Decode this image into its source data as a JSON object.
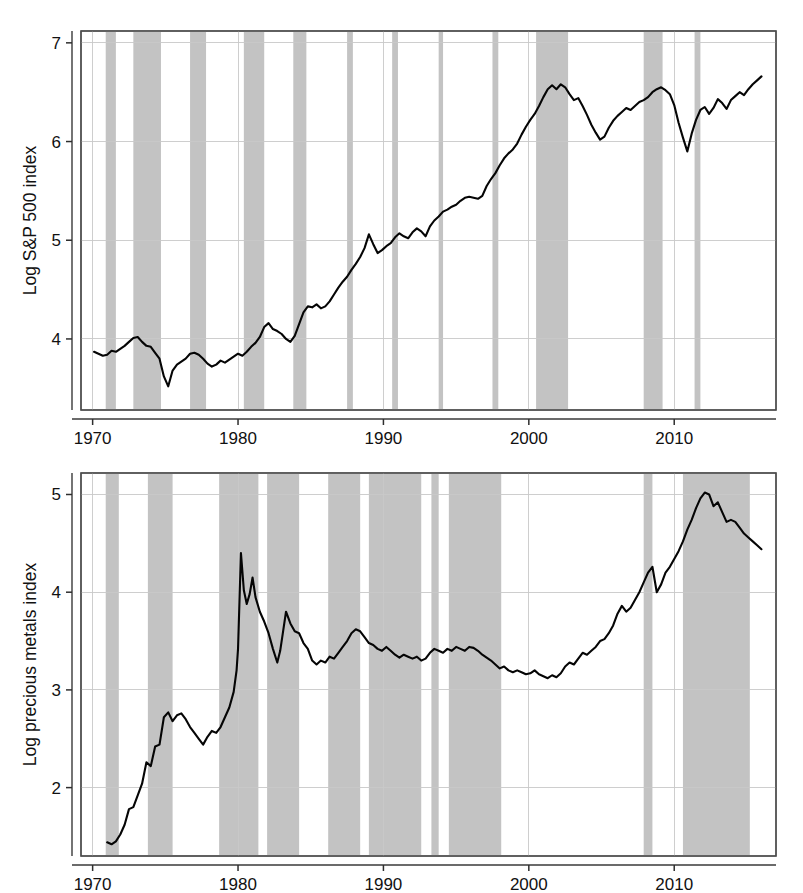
{
  "figure": {
    "width": 803,
    "height": 893,
    "background": "#ffffff",
    "line_color": "#050505",
    "band_color": "#b8b8b8",
    "grid_color": "#c9c9c9",
    "frame_color": "#4a4a4a"
  },
  "chart_data": [
    {
      "id": "sp500",
      "type": "line",
      "title": "",
      "xlabel": "",
      "ylabel": "Log S&P 500 index",
      "xlim": [
        1969.2,
        1017.0
      ],
      "x_range": [
        1969.2,
        2017.0
      ],
      "ylim": [
        3.28,
        7.12
      ],
      "grid": true,
      "legend": "none",
      "xticks": [
        1970,
        1980,
        1990,
        2000,
        2010
      ],
      "xtick_labels": [
        "1970",
        "1980",
        "1990",
        "2000",
        "2010"
      ],
      "yticks": [
        4,
        5,
        6,
        7
      ],
      "ytick_labels": [
        "4",
        "5",
        "6",
        "7"
      ],
      "shaded_regions_label": "recession bands",
      "shaded_regions": [
        [
          1970.9,
          1971.6
        ],
        [
          1972.8,
          1974.7
        ],
        [
          1976.7,
          1977.8
        ],
        [
          1980.4,
          1981.8
        ],
        [
          1983.8,
          1984.7
        ],
        [
          1987.5,
          1987.9
        ],
        [
          1990.6,
          1991.0
        ],
        [
          1993.8,
          1994.1
        ],
        [
          1997.5,
          1997.9
        ],
        [
          2000.5,
          2002.7
        ],
        [
          2007.9,
          2009.2
        ],
        [
          2011.4,
          2011.8
        ]
      ],
      "x": [
        1970.1,
        1970.4,
        1970.7,
        1971.0,
        1971.3,
        1971.6,
        1971.9,
        1972.2,
        1972.5,
        1972.8,
        1973.1,
        1973.4,
        1973.7,
        1974.0,
        1974.3,
        1974.6,
        1974.9,
        1975.2,
        1975.5,
        1975.8,
        1976.1,
        1976.4,
        1976.7,
        1977.0,
        1977.3,
        1977.6,
        1977.9,
        1978.2,
        1978.5,
        1978.8,
        1979.1,
        1979.4,
        1979.7,
        1980.0,
        1980.3,
        1980.6,
        1980.9,
        1981.2,
        1981.5,
        1981.8,
        1982.1,
        1982.4,
        1982.7,
        1983.0,
        1983.3,
        1983.6,
        1983.9,
        1984.2,
        1984.5,
        1984.8,
        1985.1,
        1985.4,
        1985.7,
        1986.0,
        1986.3,
        1986.6,
        1986.9,
        1987.2,
        1987.5,
        1987.8,
        1988.1,
        1988.4,
        1988.7,
        1989.0,
        1989.3,
        1989.6,
        1989.9,
        1990.2,
        1990.5,
        1990.8,
        1991.1,
        1991.4,
        1991.7,
        1992.0,
        1992.3,
        1992.6,
        1992.9,
        1993.2,
        1993.5,
        1993.8,
        1994.1,
        1994.4,
        1994.7,
        1995.0,
        1995.3,
        1995.6,
        1995.9,
        1996.2,
        1996.5,
        1996.8,
        1997.1,
        1997.4,
        1997.7,
        1998.0,
        1998.3,
        1998.6,
        1998.9,
        1999.2,
        1999.5,
        1999.8,
        2000.1,
        2000.4,
        2000.7,
        2001.0,
        2001.3,
        2001.6,
        2001.9,
        2002.2,
        2002.5,
        2002.8,
        2003.1,
        2003.4,
        2003.7,
        2004.0,
        2004.3,
        2004.6,
        2004.9,
        2005.2,
        2005.5,
        2005.8,
        2006.1,
        2006.4,
        2006.7,
        2007.0,
        2007.3,
        2007.6,
        2007.9,
        2008.2,
        2008.5,
        2008.8,
        2009.1,
        2009.4,
        2009.7,
        2010.0,
        2010.3,
        2010.6,
        2010.9,
        2011.2,
        2011.5,
        2011.8,
        2012.1,
        2012.4,
        2012.7,
        2013.0,
        2013.3,
        2013.6,
        2013.9,
        2014.2,
        2014.5,
        2014.8,
        2015.1,
        2015.4,
        2015.7,
        2016.0
      ],
      "y": [
        3.87,
        3.85,
        3.83,
        3.84,
        3.88,
        3.87,
        3.9,
        3.93,
        3.97,
        4.01,
        4.02,
        3.97,
        3.93,
        3.92,
        3.86,
        3.8,
        3.62,
        3.52,
        3.68,
        3.74,
        3.77,
        3.8,
        3.85,
        3.86,
        3.84,
        3.8,
        3.75,
        3.72,
        3.74,
        3.78,
        3.76,
        3.79,
        3.82,
        3.85,
        3.83,
        3.87,
        3.92,
        3.96,
        4.02,
        4.12,
        4.16,
        4.1,
        4.08,
        4.05,
        4.0,
        3.97,
        4.03,
        4.15,
        4.27,
        4.33,
        4.32,
        4.35,
        4.31,
        4.33,
        4.38,
        4.45,
        4.52,
        4.58,
        4.63,
        4.7,
        4.76,
        4.83,
        4.92,
        5.06,
        4.96,
        4.87,
        4.9,
        4.94,
        4.97,
        5.03,
        5.07,
        5.04,
        5.02,
        5.08,
        5.12,
        5.09,
        5.04,
        5.14,
        5.2,
        5.24,
        5.29,
        5.31,
        5.34,
        5.36,
        5.4,
        5.43,
        5.44,
        5.43,
        5.42,
        5.45,
        5.55,
        5.62,
        5.68,
        5.76,
        5.83,
        5.88,
        5.92,
        5.98,
        6.07,
        6.15,
        6.22,
        6.28,
        6.36,
        6.45,
        6.53,
        6.57,
        6.53,
        6.58,
        6.55,
        6.48,
        6.42,
        6.44,
        6.36,
        6.27,
        6.17,
        6.09,
        6.02,
        6.05,
        6.14,
        6.21,
        6.26,
        6.3,
        6.34,
        6.32,
        6.36,
        6.4,
        6.42,
        6.45,
        6.5,
        6.53,
        6.55,
        6.52,
        6.48,
        6.37,
        6.19,
        6.04,
        5.9,
        6.08,
        6.22,
        6.32,
        6.35,
        6.28,
        6.34,
        6.43,
        6.39,
        6.33,
        6.42,
        6.46,
        6.5,
        6.47,
        6.53,
        6.58,
        6.62,
        6.66,
        6.7,
        6.74,
        6.78,
        6.82,
        6.86,
        6.9,
        6.88,
        6.9
      ]
    },
    {
      "id": "precious-metals",
      "type": "line",
      "title": "",
      "xlabel": "",
      "ylabel": "Log precious metals index",
      "xlim": [
        1969.2,
        2017.0
      ],
      "x_range": [
        1969.2,
        2017.0
      ],
      "ylim": [
        1.3,
        5.22
      ],
      "grid": true,
      "legend": "none",
      "xticks": [
        1970,
        1980,
        1990,
        2000,
        2010
      ],
      "xtick_labels": [
        "1970",
        "1980",
        "1990",
        "2000",
        "2010"
      ],
      "yticks": [
        2,
        3,
        4,
        5
      ],
      "ytick_labels": [
        "2",
        "3",
        "4",
        "5"
      ],
      "shaded_regions_label": "recession bands",
      "shaded_regions": [
        [
          1970.9,
          1971.8
        ],
        [
          1973.8,
          1975.5
        ],
        [
          1978.7,
          1981.4
        ],
        [
          1982.0,
          1984.2
        ],
        [
          1986.2,
          1988.4
        ],
        [
          1989.0,
          1992.6
        ],
        [
          1993.3,
          1993.8
        ],
        [
          1994.5,
          1998.1
        ],
        [
          2007.9,
          2008.5
        ],
        [
          2010.6,
          2015.2
        ]
      ],
      "x": [
        1971.0,
        1971.3,
        1971.6,
        1971.9,
        1972.2,
        1972.5,
        1972.8,
        1973.1,
        1973.4,
        1973.7,
        1974.0,
        1974.3,
        1974.6,
        1974.9,
        1975.2,
        1975.5,
        1975.8,
        1976.1,
        1976.4,
        1976.7,
        1977.0,
        1977.3,
        1977.6,
        1977.9,
        1978.2,
        1978.5,
        1978.8,
        1979.1,
        1979.4,
        1979.7,
        1979.9,
        1980.0,
        1980.2,
        1980.4,
        1980.6,
        1980.8,
        1981.0,
        1981.2,
        1981.5,
        1981.8,
        1982.1,
        1982.4,
        1982.7,
        1982.9,
        1983.1,
        1983.3,
        1983.6,
        1983.9,
        1984.2,
        1984.5,
        1984.8,
        1985.1,
        1985.4,
        1985.7,
        1986.0,
        1986.3,
        1986.6,
        1986.9,
        1987.2,
        1987.5,
        1987.8,
        1988.1,
        1988.4,
        1988.7,
        1989.0,
        1989.3,
        1989.6,
        1989.9,
        1990.2,
        1990.5,
        1990.8,
        1991.1,
        1991.4,
        1991.7,
        1992.0,
        1992.3,
        1992.6,
        1992.9,
        1993.2,
        1993.5,
        1993.8,
        1994.1,
        1994.4,
        1994.7,
        1995.0,
        1995.3,
        1995.6,
        1995.9,
        1996.2,
        1996.5,
        1996.8,
        1997.1,
        1997.4,
        1997.7,
        1998.0,
        1998.3,
        1998.6,
        1998.9,
        1999.2,
        1999.5,
        1999.8,
        2000.1,
        2000.4,
        2000.7,
        2001.0,
        2001.3,
        2001.6,
        2001.9,
        2002.2,
        2002.5,
        2002.8,
        2003.1,
        2003.4,
        2003.7,
        2004.0,
        2004.3,
        2004.6,
        2004.9,
        2005.2,
        2005.5,
        2005.8,
        2006.1,
        2006.4,
        2006.7,
        2007.0,
        2007.3,
        2007.6,
        2007.9,
        2008.2,
        2008.5,
        2008.8,
        2009.1,
        2009.4,
        2009.7,
        2010.0,
        2010.3,
        2010.6,
        2010.9,
        2011.2,
        2011.5,
        2011.8,
        2012.1,
        2012.4,
        2012.7,
        2013.0,
        2013.3,
        2013.6,
        2013.9,
        2014.2,
        2014.5,
        2014.8,
        2015.1,
        2015.4,
        2015.7,
        2016.0
      ],
      "y": [
        1.44,
        1.42,
        1.45,
        1.52,
        1.62,
        1.78,
        1.8,
        1.92,
        2.04,
        2.26,
        2.22,
        2.42,
        2.44,
        2.72,
        2.77,
        2.68,
        2.74,
        2.76,
        2.7,
        2.62,
        2.56,
        2.5,
        2.44,
        2.52,
        2.58,
        2.56,
        2.62,
        2.72,
        2.82,
        2.98,
        3.2,
        3.42,
        4.4,
        4.02,
        3.88,
        3.98,
        4.15,
        3.95,
        3.8,
        3.7,
        3.58,
        3.42,
        3.28,
        3.4,
        3.6,
        3.8,
        3.68,
        3.6,
        3.58,
        3.48,
        3.42,
        3.3,
        3.26,
        3.3,
        3.28,
        3.34,
        3.32,
        3.38,
        3.44,
        3.5,
        3.58,
        3.62,
        3.6,
        3.54,
        3.48,
        3.46,
        3.42,
        3.4,
        3.44,
        3.4,
        3.36,
        3.33,
        3.36,
        3.34,
        3.32,
        3.34,
        3.3,
        3.32,
        3.38,
        3.42,
        3.4,
        3.38,
        3.42,
        3.4,
        3.44,
        3.42,
        3.4,
        3.44,
        3.43,
        3.4,
        3.36,
        3.33,
        3.3,
        3.26,
        3.22,
        3.24,
        3.2,
        3.18,
        3.2,
        3.18,
        3.16,
        3.17,
        3.2,
        3.16,
        3.14,
        3.12,
        3.15,
        3.13,
        3.17,
        3.24,
        3.28,
        3.26,
        3.32,
        3.38,
        3.36,
        3.4,
        3.44,
        3.5,
        3.52,
        3.58,
        3.66,
        3.78,
        3.86,
        3.8,
        3.84,
        3.92,
        4.0,
        4.1,
        4.2,
        4.26,
        4.0,
        4.08,
        4.2,
        4.26,
        4.34,
        4.42,
        4.52,
        4.64,
        4.74,
        4.86,
        4.96,
        5.02,
        5.0,
        4.88,
        4.92,
        4.82,
        4.72,
        4.74,
        4.72,
        4.66,
        4.6,
        4.56,
        4.52,
        4.48,
        4.44
      ]
    }
  ],
  "panels": {
    "top": {
      "name": "Log S&P 500 index panel"
    },
    "bottom": {
      "name": "Log precious metals index panel"
    }
  }
}
